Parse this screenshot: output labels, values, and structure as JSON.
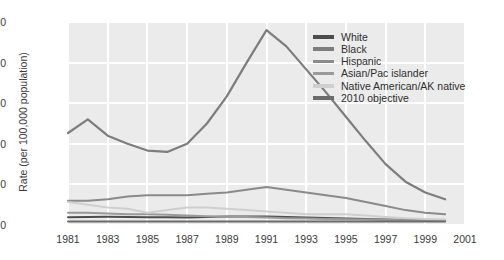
{
  "chart_data": {
    "type": "line",
    "title": "",
    "xlabel": "",
    "ylabel": "Rate (per 100,000 population)",
    "xlim": [
      1981,
      2001
    ],
    "ylim": [
      0,
      150
    ],
    "yticks": [
      0,
      30,
      60,
      90,
      120,
      150
    ],
    "xticks": [
      1981,
      1983,
      1985,
      1987,
      1989,
      1991,
      1993,
      1995,
      1997,
      1999,
      2001
    ],
    "grid": true,
    "legend_position": "top-right",
    "x": [
      1981,
      1982,
      1983,
      1984,
      1985,
      1986,
      1987,
      1988,
      1989,
      1990,
      1991,
      1992,
      1993,
      1994,
      1995,
      1996,
      1997,
      1998,
      1999,
      2000
    ],
    "series": [
      {
        "name": "White",
        "color": "#4d4d4d",
        "values": [
          5.8,
          6.0,
          6.1,
          6.0,
          5.8,
          5.7,
          5.6,
          5.9,
          6.2,
          6.3,
          6.2,
          5.9,
          5.5,
          5.1,
          4.8,
          4.5,
          4.1,
          3.8,
          3.6,
          3.5
        ]
      },
      {
        "name": "Black",
        "color": "#7d7d7d",
        "values": [
          68,
          78,
          66,
          60,
          55,
          54,
          60,
          75,
          95,
          120,
          144,
          132,
          115,
          98,
          80,
          62,
          45,
          32,
          24,
          19
        ]
      },
      {
        "name": "Hispanic",
        "color": "#8a8a8a",
        "values": [
          18,
          18,
          19,
          21,
          22,
          22,
          22,
          23,
          24,
          26,
          28,
          26,
          24,
          22,
          20,
          17,
          14,
          11,
          9,
          8
        ]
      },
      {
        "name": "Asian/Pac islander",
        "color": "#9a9a9a",
        "values": [
          9,
          9,
          8.5,
          8,
          8,
          7.5,
          7,
          6.5,
          6,
          6,
          5.5,
          5,
          4.8,
          4.5,
          4.2,
          4,
          3.8,
          3.6,
          3.4,
          3.2
        ]
      },
      {
        "name": "Native American/AK native",
        "color": "#cfcfcf",
        "values": [
          17,
          15,
          13,
          12,
          9,
          11,
          13,
          13,
          12,
          11,
          10,
          9,
          8,
          8,
          8,
          7,
          6,
          5,
          4.5,
          4
        ]
      },
      {
        "name": "2010 objective",
        "color": "#6b6b6b",
        "values": [
          2.5,
          2.5,
          2.5,
          2.5,
          2.5,
          2.5,
          2.5,
          2.5,
          2.5,
          2.5,
          2.5,
          2.5,
          2.5,
          2.5,
          2.5,
          2.5,
          2.5,
          2.5,
          2.5,
          2.5
        ]
      }
    ]
  },
  "legend": {
    "items": [
      {
        "label": "White"
      },
      {
        "label": "Black"
      },
      {
        "label": "Hispanic"
      },
      {
        "label": "Asian/Pac islander"
      },
      {
        "label": "Native American/AK native"
      },
      {
        "label": "2010 objective"
      }
    ]
  },
  "style": {
    "panel_bg": "#ebebeb",
    "grid_color": "#ffffff",
    "text_color": "#3a3a3a",
    "page_bg": "#ffffff"
  }
}
